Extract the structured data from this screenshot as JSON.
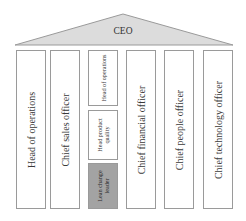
{
  "diagram": {
    "type": "org-structure-temple",
    "roof": {
      "label": "CEO",
      "fill": "#dcdcdc",
      "stroke": "#9a9a9a"
    },
    "pillars": [
      {
        "label": "Head of operations"
      },
      {
        "label": "Chief sales officer"
      },
      {
        "stack": [
          {
            "label": "Head of operations",
            "highlight": false
          },
          {
            "label": "Head product quality",
            "highlight": false
          },
          {
            "label": "Lean change leader",
            "highlight": true,
            "fill": "#a3a3a3"
          }
        ]
      },
      {
        "label": "Chief financial officer"
      },
      {
        "label": "Chief people officer"
      },
      {
        "label": "Chief technology officer"
      }
    ]
  }
}
